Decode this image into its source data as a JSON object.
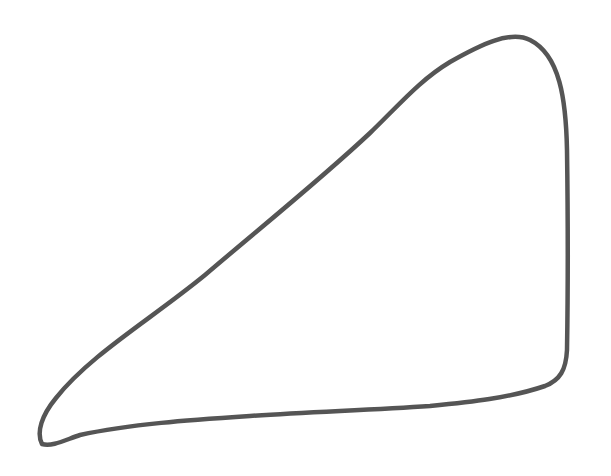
{
  "drawing": {
    "subject": "hand-drawn triangle",
    "stroke_color": "#555555",
    "background_color": "#ffffff",
    "stroke_width": 4.5,
    "path": "M 42 444 C 36 432, 42 415, 56 398 C 90 355, 150 320, 205 275 C 260 228, 320 180, 370 133 C 400 104, 420 80, 450 62 C 480 45, 510 30, 530 40 C 560 55, 566 100, 567 150 C 568 220, 568 290, 567 350 C 566 370, 560 380, 545 386 C 510 398, 470 402, 430 406 C 370 410, 310 412, 250 416 C 190 420, 130 424, 80 435 C 65 440, 52 447, 42 444 Z"
  }
}
